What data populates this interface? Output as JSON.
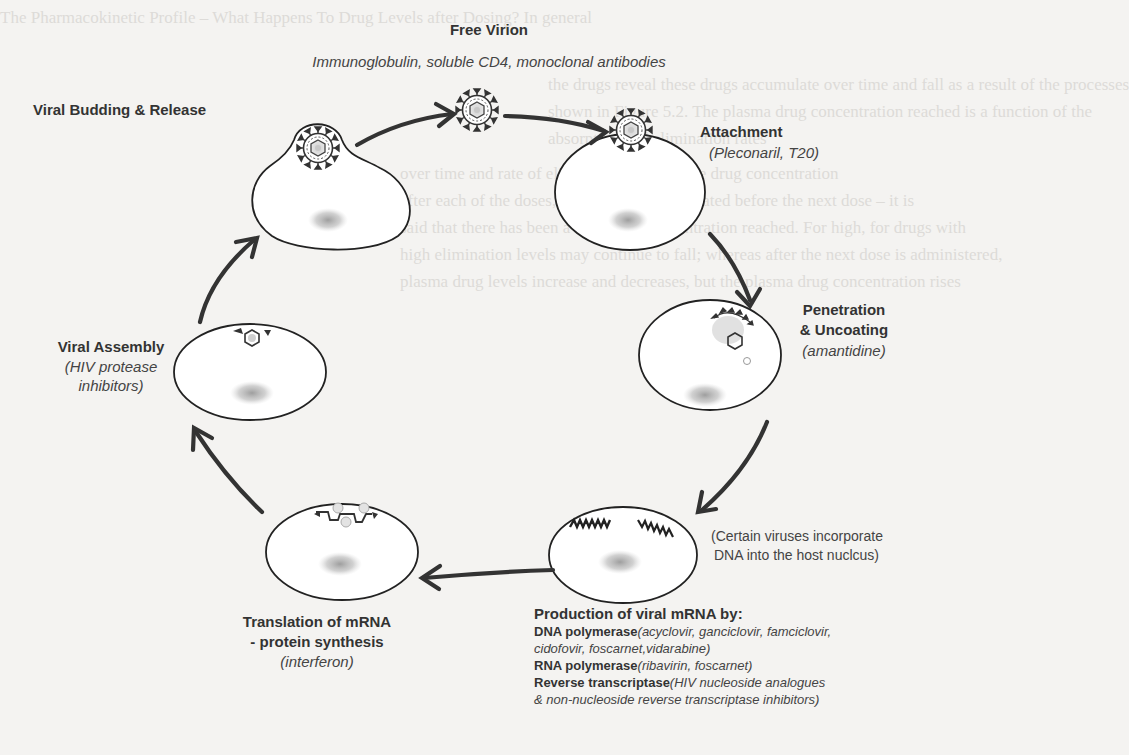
{
  "diagram": {
    "background_bleed_text": [
      "The Pharmacokinetic Profile – What Happens To Drug Levels after Dosing? In general",
      "",
      "the drugs reveal these drugs accumulate over time and fall as a result of the processes",
      "shown in Figure 5.2. The plasma drug concentration reached is a function of the",
      "absorption and elimination rates",
      "           over time and rate of elimination exceeds the drug concentration",
      "after each of the doses, not all drug is eliminated before the next dose – it is",
      "said that there has been a minimum concentration reached. For high, for drugs with",
      "high elimination levels may continue to fall; whereas after the next dose is administered,",
      "plasma drug levels increase and decreases, but the plasma drug concentration rises"
    ],
    "stages": [
      {
        "id": "free-virion",
        "title": "Free Virion",
        "drugs": "Immunoglobulin, soluble CD4, monoclonal antibodies"
      },
      {
        "id": "attachment",
        "title": "Attachment",
        "drugs": "(Pleconaril, T20)"
      },
      {
        "id": "penetration",
        "title_line1": "Penetration",
        "title_line2": "& Uncoating",
        "drugs": "(amantidine)"
      },
      {
        "id": "mrna-production",
        "note_line1": "(Certain viruses incorporate",
        "note_line2": "DNA into the host nuclcus)",
        "heading": "Production of viral mRNA by:",
        "enzymes": [
          {
            "name": "DNA polymerase",
            "drugs": "(acyclovir, ganciclovir, famciclovir,",
            "drugs_cont": "cidofovir, foscarnet,vidarabine)"
          },
          {
            "name": "RNA polymerase",
            "drugs": "(ribavirin, foscarnet)"
          },
          {
            "name": "Reverse transcriptase",
            "drugs": "(HIV nucleoside analogues",
            "drugs_cont": "& non-nucleoside reverse transcriptase inhibitors)"
          }
        ]
      },
      {
        "id": "translation",
        "title_line1": "Translation of mRNA",
        "title_line2": "- protein synthesis",
        "drugs": "(interferon)"
      },
      {
        "id": "assembly",
        "title": "Viral Assembly",
        "drugs_line1": "(HIV protease",
        "drugs_line2": "inhibitors)"
      },
      {
        "id": "budding",
        "title": "Viral Budding & Release"
      }
    ],
    "colors": {
      "ink": "#2a2a2a",
      "arrow": "#333333",
      "nucleus": "#a9a9a9",
      "background": "#f4f3f1"
    }
  }
}
